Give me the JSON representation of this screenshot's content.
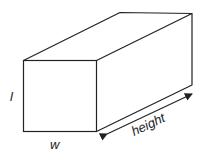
{
  "figure": {
    "type": "rectangular-prism",
    "stroke_color": "#222222",
    "background": "#ffffff",
    "labels": {
      "length": "l",
      "width": "w",
      "height": "height"
    }
  }
}
